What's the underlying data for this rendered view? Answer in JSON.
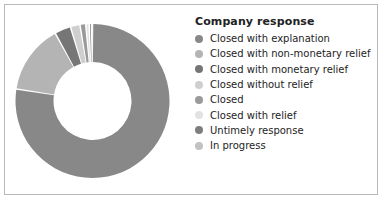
{
  "figure": {
    "background": "#ffffff",
    "border_color": "#b9b9b9"
  },
  "legend": {
    "title": "Company response",
    "title_color": "#222222",
    "label_color": "#232323",
    "items": [
      {
        "label": "Closed with explanation",
        "color": "#888888",
        "swatch_name": "legend-swatch-closed-with-explanation"
      },
      {
        "label": "Closed with non-monetary relief",
        "color": "#b4b4b4",
        "swatch_name": "legend-swatch-closed-with-non-monetary-relief"
      },
      {
        "label": "Closed with monetary relief",
        "color": "#767676",
        "swatch_name": "legend-swatch-closed-with-monetary-relief"
      },
      {
        "label": "Closed without relief",
        "color": "#cfcfcf",
        "swatch_name": "legend-swatch-closed-without-relief"
      },
      {
        "label": "Closed",
        "color": "#9a9a9a",
        "swatch_name": "legend-swatch-closed"
      },
      {
        "label": "Closed with relief",
        "color": "#e2e2e2",
        "swatch_name": "legend-swatch-closed-with-relief"
      },
      {
        "label": "Untimely response",
        "color": "#7e7e7e",
        "swatch_name": "legend-swatch-untimely-response"
      },
      {
        "label": "In progress",
        "color": "#c2c2c2",
        "swatch_name": "legend-swatch-in-progress"
      }
    ]
  },
  "chart_data": {
    "type": "pie",
    "title": "",
    "variant": "donut",
    "hole_ratio": 0.5,
    "start_angle_deg": -90,
    "direction": "clockwise",
    "legend_position": "right",
    "legend_title": "Company response",
    "grid": false,
    "center": {
      "x": 91.5,
      "y": 100
    },
    "outer_radius": 77,
    "inner_radius": 39,
    "wedge_gap_deg": 1.2,
    "categories": [
      "Closed with explanation",
      "Closed with non-monetary relief",
      "Closed with monetary relief",
      "Closed without relief",
      "Closed",
      "Closed with relief",
      "Untimely response",
      "In progress"
    ],
    "values": [
      77.5,
      14.5,
      3.4,
      2.0,
      1.2,
      0.7,
      0.5,
      0.2
    ],
    "unit": "percent",
    "colors": [
      "#888888",
      "#b4b4b4",
      "#767676",
      "#cfcfcf",
      "#9a9a9a",
      "#e2e2e2",
      "#7e7e7e",
      "#c2c2c2"
    ]
  }
}
